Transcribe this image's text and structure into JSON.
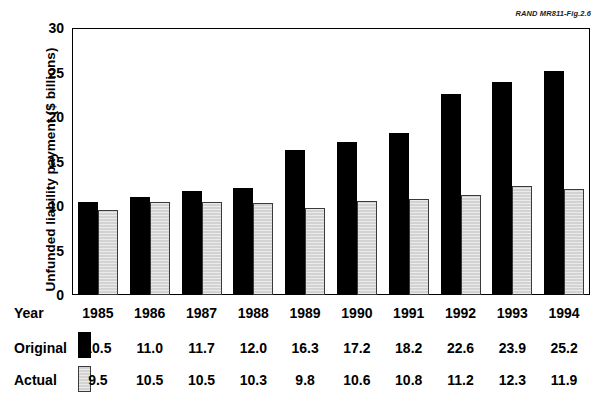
{
  "source_credit": "RAND MR811-Fig.2.6",
  "axis": {
    "ylabel": "Unfunded liability payment ($ billions)",
    "yticks": [
      "0",
      "5",
      "10",
      "15",
      "20",
      "25",
      "30"
    ]
  },
  "table": {
    "row_labels": {
      "year": "Year",
      "original": "Original",
      "actual": "Actual"
    },
    "legend": {
      "original_swatch": "black-bar-swatch",
      "actual_swatch": "gray-bar-swatch"
    }
  },
  "colors": {
    "original": "#000000",
    "actual": "#d2d2d2",
    "actual_border": "#3a3a3a",
    "axis": "#000000",
    "background": "#ffffff"
  },
  "chart_data": {
    "type": "bar",
    "title": "",
    "subtitle": "",
    "xlabel": "Year",
    "ylabel": "Unfunded liability payment ($ billions)",
    "ylim": [
      0,
      30
    ],
    "ytick_step": 5,
    "grid": false,
    "legend_position": "below-table",
    "categories": [
      "1985",
      "1986",
      "1987",
      "1988",
      "1989",
      "1990",
      "1991",
      "1992",
      "1993",
      "1994"
    ],
    "series": [
      {
        "name": "Original",
        "color": "#000000",
        "values": [
          10.5,
          11.0,
          11.7,
          12.0,
          16.3,
          17.2,
          18.2,
          22.6,
          23.9,
          25.2
        ],
        "labels": [
          "10.5",
          "11.0",
          "11.7",
          "12.0",
          "16.3",
          "17.2",
          "18.2",
          "22.6",
          "23.9",
          "25.2"
        ]
      },
      {
        "name": "Actual",
        "color": "#d2d2d2",
        "values": [
          9.5,
          10.5,
          10.5,
          10.3,
          9.8,
          10.6,
          10.8,
          11.2,
          12.3,
          11.9
        ],
        "labels": [
          "9.5",
          "10.5",
          "10.5",
          "10.3",
          "9.8",
          "10.6",
          "10.8",
          "11.2",
          "12.3",
          "11.9"
        ]
      }
    ]
  }
}
